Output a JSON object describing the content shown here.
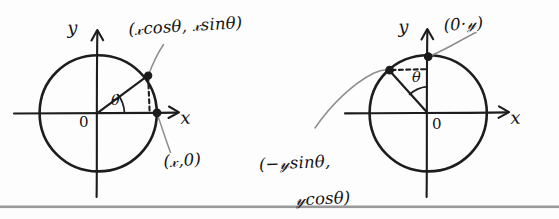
{
  "figure": {
    "background_color": "#fdfdfd",
    "ink_color": "#1d1d1d",
    "leader_color": "#8e8e8e",
    "rule_color": "#9a9a9a"
  },
  "diagrams": [
    {
      "id": "left",
      "name": "rotation-of-point-on-x-axis",
      "axis_x_label": "x",
      "axis_y_label": "y",
      "origin_label": "0",
      "angle_label": "θ",
      "points": [
        {
          "name": "rotated-point",
          "label": "(𝓍cosθ, 𝓍sinθ)",
          "label_parts": {
            "open": "(",
            "first": "𝓍cosθ",
            "comma": ", ",
            "second": "𝓍sinθ",
            "close": ")"
          }
        },
        {
          "name": "original-point",
          "label": "(𝓍,0)"
        }
      ]
    },
    {
      "id": "right",
      "name": "rotation-of-point-on-y-axis",
      "axis_x_label": "x",
      "axis_y_label": "y",
      "origin_label": "0",
      "angle_label": "θ",
      "points": [
        {
          "name": "original-point",
          "label": "(0·𝓎)"
        },
        {
          "name": "rotated-point",
          "label": "(−𝓎sinθ, 𝓎cosθ)",
          "line1": "(−𝓎sinθ,",
          "line2": "𝓎cosθ)"
        }
      ]
    }
  ]
}
